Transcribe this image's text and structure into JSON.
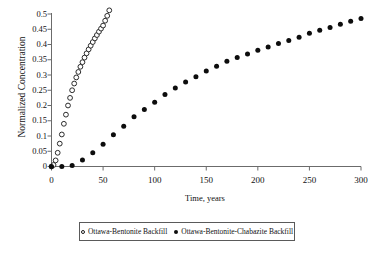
{
  "chart_data": {
    "type": "scatter",
    "title": "",
    "xlabel": "Time, years",
    "ylabel": "Normalized Concentration",
    "xlim": [
      0,
      300
    ],
    "ylim": [
      0,
      0.5
    ],
    "grid": false,
    "legend_position": "bottom",
    "xticks": [
      0,
      50,
      100,
      150,
      200,
      250,
      300
    ],
    "xtick_labels": [
      "0",
      "50",
      "100",
      "150",
      "200",
      "250",
      "300"
    ],
    "yticks": [
      0,
      0.05,
      0.1,
      0.15,
      0.2,
      0.25,
      0.3,
      0.35,
      0.4,
      0.45,
      0.5
    ],
    "ytick_labels": [
      "0",
      "0.05",
      "0.1",
      "0.15",
      "0.2",
      "0.25",
      "0.3",
      "0.35",
      "0.4",
      "0.45",
      "0.5"
    ],
    "series": [
      {
        "name": "Ottawa-Bentonite Backfill",
        "marker": "open-circle",
        "color": "#2b2b2b",
        "note": "curve continues above the 0.5 axis maximum and is clipped",
        "x": [
          0,
          2,
          4,
          6,
          8,
          10,
          12,
          14,
          16,
          18,
          20,
          22,
          24,
          26,
          28,
          30,
          32,
          34,
          36,
          38,
          40,
          42,
          44,
          46,
          48,
          50,
          52,
          54,
          56
        ],
        "y": [
          0.0,
          0.005,
          0.02,
          0.045,
          0.075,
          0.105,
          0.14,
          0.17,
          0.2,
          0.225,
          0.25,
          0.272,
          0.292,
          0.31,
          0.327,
          0.342,
          0.357,
          0.371,
          0.384,
          0.396,
          0.408,
          0.42,
          0.431,
          0.442,
          0.452,
          0.462,
          0.478,
          0.494,
          0.512
        ]
      },
      {
        "name": "Ottawa-Bentonite-Chabazite Backfill",
        "marker": "filled-circle",
        "color": "#0d0d0d",
        "x": [
          0,
          10,
          20,
          30,
          40,
          50,
          60,
          70,
          80,
          90,
          100,
          110,
          120,
          130,
          140,
          150,
          160,
          170,
          180,
          190,
          200,
          210,
          220,
          230,
          240,
          250,
          260,
          270,
          280,
          290,
          300
        ],
        "y": [
          0.0,
          0.0,
          0.003,
          0.021,
          0.045,
          0.073,
          0.104,
          0.132,
          0.163,
          0.187,
          0.211,
          0.236,
          0.257,
          0.277,
          0.294,
          0.313,
          0.329,
          0.345,
          0.357,
          0.369,
          0.381,
          0.392,
          0.403,
          0.413,
          0.424,
          0.437,
          0.447,
          0.456,
          0.466,
          0.476,
          0.485
        ]
      }
    ]
  },
  "legend": {
    "entries": [
      {
        "label": "Ottawa-Bentonite Backfill",
        "marker": "open-circle"
      },
      {
        "label": "Ottawa-Bentonite-Chabazite Backfill",
        "marker": "filled-circle"
      }
    ]
  },
  "axes": {
    "x_title": "Time, years",
    "y_title": "Normalized Concentration"
  }
}
